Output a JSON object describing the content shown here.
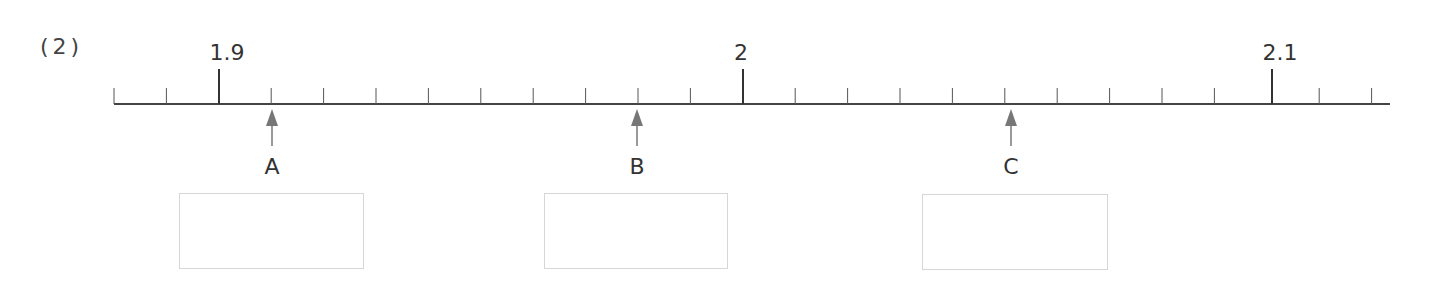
{
  "question_number": "(2)",
  "number_line": {
    "axis": {
      "x_start": 114,
      "x_end": 1390,
      "y": 104,
      "color": "#444444"
    },
    "major_ticks": [
      {
        "value": "1.9",
        "x": 219
      },
      {
        "value": "2",
        "x": 743
      },
      {
        "value": "2.1",
        "x": 1272
      }
    ],
    "minor_tick_spacing_px": 52.4,
    "first_tick_x": 114,
    "tick_count": 25,
    "unit_per_minor_tick": 0.01
  },
  "points": [
    {
      "label": "A",
      "x": 272,
      "value_hint": "1.91"
    },
    {
      "label": "B",
      "x": 637,
      "value_hint": "1.98"
    },
    {
      "label": "C",
      "x": 1011,
      "value_hint": "2.05"
    }
  ],
  "answer_boxes": [
    {
      "for": "A",
      "left": 179,
      "top": 193,
      "width": 185,
      "height": 76,
      "value": ""
    },
    {
      "for": "B",
      "left": 544,
      "top": 193,
      "width": 184,
      "height": 76,
      "value": ""
    },
    {
      "for": "C",
      "left": 922,
      "top": 194,
      "width": 186,
      "height": 76,
      "value": ""
    }
  ],
  "colors": {
    "line": "#444444",
    "arrow": "#777777",
    "box_border": "#d6d6d6"
  }
}
